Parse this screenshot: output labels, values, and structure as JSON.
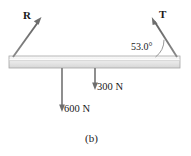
{
  "figure": {
    "caption": "(b)",
    "beam": {
      "name": "horizontal-beam",
      "fill_top": "#f2f2f2",
      "fill_bottom": "#d8d8d8",
      "stroke": "#9a9a9a",
      "x": 9,
      "y": 56,
      "width": 171,
      "height": 12
    },
    "vectors": [
      {
        "id": "R",
        "label": "R",
        "description": "reaction-force-left",
        "color": "#6e6e6e",
        "x1": 13,
        "y1": 57,
        "x2": 41,
        "y2": 18
      },
      {
        "id": "T",
        "label": "T",
        "description": "tension-force-right",
        "color": "#6e6e6e",
        "x1": 177,
        "y1": 57,
        "x2": 152,
        "y2": 18
      }
    ],
    "loads": [
      {
        "id": "load-300",
        "label": "300 N",
        "value": 300,
        "unit": "N",
        "color": "#6e6e6e",
        "x": 95,
        "y1": 68,
        "y2": 89
      },
      {
        "id": "load-600",
        "label": "600 N",
        "value": 600,
        "unit": "N",
        "color": "#6e6e6e",
        "x": 62,
        "y1": 68,
        "y2": 111
      }
    ],
    "angle": {
      "label": "53.0°",
      "value": 53.0,
      "unit": "degrees",
      "vertex_x": 177,
      "vertex_y": 57,
      "arc_radius": 22
    }
  }
}
